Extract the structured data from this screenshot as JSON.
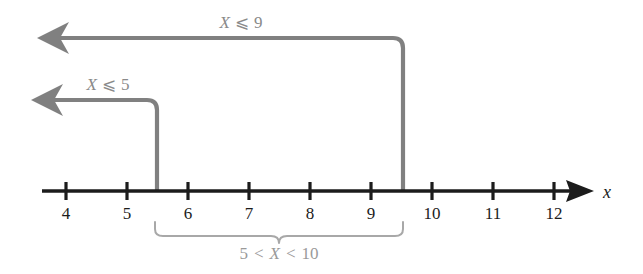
{
  "figure": {
    "background_color": "#ffffff",
    "axis_color": "#1c1c1c",
    "ray_color": "#808080",
    "brace_color": "#a8a8a8",
    "label_color": "#8a8a8a"
  },
  "axis": {
    "variable_label": "x",
    "start_x": 42,
    "end_x": 593,
    "y": 191,
    "tick_spacing_px": 61,
    "ticks": [
      {
        "value": 4,
        "label": "4",
        "x": 66
      },
      {
        "value": 5,
        "label": "5",
        "x": 127
      },
      {
        "value": 6,
        "label": "6",
        "x": 188
      },
      {
        "value": 7,
        "label": "7",
        "x": 249
      },
      {
        "value": 8,
        "label": "8",
        "x": 310
      },
      {
        "value": 9,
        "label": "9",
        "x": 371
      },
      {
        "value": 10,
        "label": "10",
        "x": 432
      },
      {
        "value": 11,
        "label": "11",
        "x": 493
      },
      {
        "value": 12,
        "label": "12",
        "x": 554
      }
    ]
  },
  "rays": [
    {
      "id": "ray-x-le-9",
      "label_prefix": "X",
      "label_operator": "⩽",
      "label_value": "9",
      "label_text": "X ⩽ 9",
      "label_x": 241,
      "label_y": 28,
      "horizontal_y": 38,
      "arrow_tip_x": 38,
      "corner_x": 403,
      "drop_to_y": 191,
      "boundary_value": 9.5
    },
    {
      "id": "ray-x-le-5",
      "label_prefix": "X",
      "label_operator": "⩽",
      "label_value": "5",
      "label_text": "X ⩽ 5",
      "label_x": 108,
      "label_y": 90,
      "horizontal_y": 100,
      "arrow_tip_x": 32,
      "corner_x": 157,
      "drop_to_y": 191,
      "boundary_value": 5.5
    }
  ],
  "brace": {
    "left_x": 155,
    "right_x": 403,
    "top_y": 222,
    "depth_y": 236,
    "label_text": "5 < X < 10",
    "label_parts": {
      "lower": "5",
      "op1": "<",
      "var": "X",
      "op2": "<",
      "upper": "10"
    },
    "label_x": 279,
    "label_y": 259
  },
  "chart_data": {
    "type": "number-line",
    "title": "",
    "xlabel": "x",
    "ylabel": "",
    "xlim": [
      3.6,
      12.6
    ],
    "xticks": [
      4,
      5,
      6,
      7,
      8,
      9,
      10,
      11,
      12
    ],
    "xticklabels": [
      "4",
      "5",
      "6",
      "7",
      "8",
      "9",
      "10",
      "11",
      "12"
    ],
    "grid": false,
    "legend": "none",
    "annotations": [
      {
        "text": "X ⩽ 9",
        "type": "ray-left",
        "boundary_tick": 9.5,
        "direction": "negative-infinity",
        "inclusive": true,
        "color": "#808080"
      },
      {
        "text": "X ⩽ 5",
        "type": "ray-left",
        "boundary_tick": 5.5,
        "direction": "negative-infinity",
        "inclusive": true,
        "color": "#808080"
      },
      {
        "text": "5 < X < 10",
        "type": "brace-interval",
        "interval_start": 5.5,
        "interval_end": 9.5,
        "inclusive": false,
        "color": "#a8a8a8"
      }
    ]
  }
}
